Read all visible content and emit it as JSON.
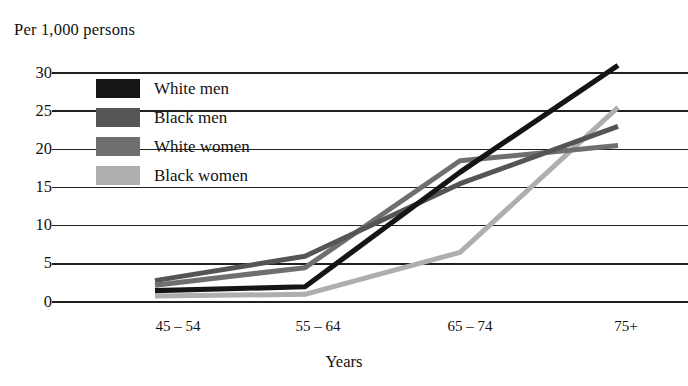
{
  "chart_data": {
    "type": "line",
    "title": "",
    "ylabel": "Per 1,000 persons",
    "xlabel": "Years",
    "categories": [
      "45 – 54",
      "55 – 64",
      "65 – 74",
      "75+"
    ],
    "ylim": [
      0,
      30
    ],
    "yticks": [
      0,
      5,
      10,
      15,
      20,
      25,
      30
    ],
    "ytick_labels": [
      "0",
      "5",
      "10",
      "15",
      "20",
      "25",
      "30"
    ],
    "grid": true,
    "legend_position": "upper-left-inside",
    "series": [
      {
        "name": "White men",
        "color": "#151515",
        "values": [
          1.5,
          2.0,
          17.0,
          31.0
        ]
      },
      {
        "name": "Black men",
        "color": "#555555",
        "values": [
          2.8,
          6.0,
          15.5,
          23.0
        ]
      },
      {
        "name": "White women",
        "color": "#6f6f6f",
        "values": [
          2.2,
          4.5,
          18.5,
          20.5
        ]
      },
      {
        "name": "Black women",
        "color": "#aeaeae",
        "values": [
          0.8,
          1.0,
          6.5,
          25.5
        ]
      }
    ]
  },
  "axes": {
    "y_title": "Per 1,000 persons",
    "x_title": "Years",
    "y_tick_labels": [
      "30",
      "25",
      "20",
      "15",
      "10",
      "5",
      "0"
    ],
    "x_tick_labels": [
      "45 – 54",
      "55 – 64",
      "65 – 74",
      "75+"
    ]
  },
  "legend": {
    "items": [
      {
        "label": "White men",
        "swatch": "#151515"
      },
      {
        "label": "Black men",
        "swatch": "#555555"
      },
      {
        "label": "White women",
        "swatch": "#6f6f6f"
      },
      {
        "label": "Black women",
        "swatch": "#aeaeae"
      }
    ]
  }
}
